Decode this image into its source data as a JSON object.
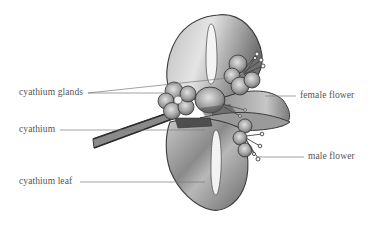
{
  "figure": {
    "labels": {
      "cyathium_glands": "cyathium glands",
      "cyathium": "cyathium",
      "cyathium_leaf": "cyathium leaf",
      "female_flower": "female flower",
      "male_flower": "male flower"
    },
    "colors": {
      "background": "#ffffff",
      "label_text": "#555555",
      "leader_line": "#7a7a7a",
      "outline": "#3a3a3a",
      "leaf_light": "#e6e6e6",
      "leaf_mid": "#a8a8a8",
      "leaf_dark": "#5e5e5e"
    }
  }
}
